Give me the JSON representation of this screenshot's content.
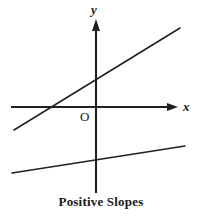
{
  "figure": {
    "caption": "Positive Slopes",
    "width": 202,
    "height": 218,
    "background_color": "#ffffff",
    "ink_color": "#231f20"
  },
  "labels": {
    "y_axis": "y",
    "x_axis": "x",
    "origin": "O"
  },
  "chart_data": {
    "type": "line",
    "title": "Positive Slopes",
    "xlabel": "x",
    "ylabel": "y",
    "grid": false,
    "legend": "none",
    "axes": {
      "x_axis": {
        "label": "x",
        "pixel_y": 107,
        "pixel_x_start": 11,
        "pixel_x_end": 178,
        "arrow": "right",
        "ticks": [],
        "tick_labels": []
      },
      "y_axis": {
        "label": "y",
        "pixel_x": 96,
        "pixel_y_start": 193,
        "pixel_y_end": 20,
        "arrow": "up",
        "ticks": [],
        "tick_labels": []
      },
      "origin": {
        "label": "O",
        "pixel_x": 96,
        "pixel_y": 107
      }
    },
    "series": [
      {
        "name": "steep-positive-line",
        "description": "Line with a steep positive slope crossing both axes",
        "slope_sign": "positive",
        "pixel_points": [
          [
            14,
            130
          ],
          [
            180,
            28
          ]
        ],
        "x_intercept_pixel": 32,
        "y_intercept_pixel": 78
      },
      {
        "name": "shallow-positive-line",
        "description": "Line with a small positive slope entirely below the x-axis",
        "slope_sign": "positive",
        "pixel_points": [
          [
            12,
            173
          ],
          [
            185,
            146
          ]
        ],
        "x_intercept_pixel": null,
        "y_intercept_pixel": 160
      }
    ],
    "annotations": [
      {
        "text": "Positive Slopes",
        "role": "caption",
        "pixel_x": 102,
        "pixel_y": 204
      }
    ]
  }
}
